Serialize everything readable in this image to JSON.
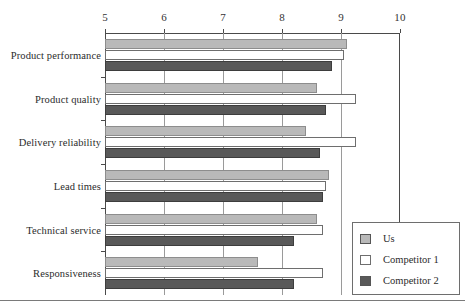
{
  "chart_data": {
    "type": "bar",
    "orientation": "horizontal",
    "title": "",
    "xlabel": "",
    "ylabel": "",
    "xlim": [
      5,
      10
    ],
    "xticks": [
      5,
      6,
      7,
      8,
      9,
      10
    ],
    "xtick_labels": [
      "5",
      "6",
      "7",
      "8",
      "9",
      "10"
    ],
    "grid": true,
    "axis_position": "top",
    "legend_position": "bottom-right",
    "categories": [
      "Product performance",
      "Product quality",
      "Delivery reliability",
      "Lead times",
      "Technical service",
      "Responsiveness"
    ],
    "series": [
      {
        "name": "Us",
        "color": "#b9b9b9",
        "values": [
          9.1,
          8.6,
          8.4,
          8.8,
          8.6,
          7.6
        ]
      },
      {
        "name": "Competitor 1",
        "color": "#ffffff",
        "values": [
          9.05,
          9.25,
          9.25,
          8.75,
          8.7,
          8.7
        ]
      },
      {
        "name": "Competitor 2",
        "color": "#595959",
        "values": [
          8.85,
          8.75,
          8.65,
          8.7,
          8.2,
          8.2
        ]
      }
    ]
  },
  "legend": {
    "items": [
      {
        "label": "Us",
        "swatch": "#b9b9b9"
      },
      {
        "label": "Competitor 1",
        "swatch": "#ffffff"
      },
      {
        "label": "Competitor 2",
        "swatch": "#595959"
      }
    ]
  }
}
